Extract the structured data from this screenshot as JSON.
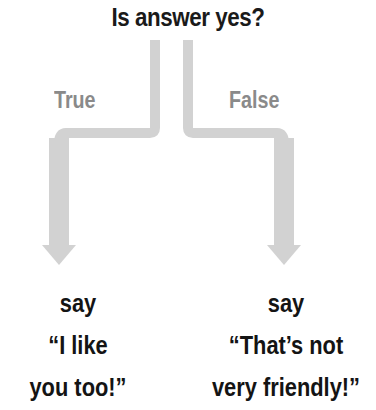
{
  "diagram": {
    "question": "Is answer yes?",
    "branches": [
      {
        "label": "True",
        "outcome_lines": [
          "say",
          "“I like",
          "you too!”"
        ]
      },
      {
        "label": "False",
        "outcome_lines": [
          "say",
          "“That’s not",
          "very friendly!”"
        ]
      }
    ],
    "colors": {
      "arrow": "#d2d2d2",
      "branch_label": "#8a8a8a",
      "text": "#141414"
    }
  }
}
